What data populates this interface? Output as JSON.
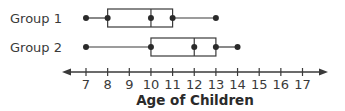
{
  "chart_data": {
    "type": "boxplot",
    "title": "",
    "xlabel": "Age of Children",
    "ylabel": "",
    "x_ticks": [
      7,
      8,
      9,
      10,
      11,
      12,
      13,
      14,
      15,
      16,
      17
    ],
    "xlim": [
      6,
      18
    ],
    "grid": false,
    "legend": null,
    "series": [
      {
        "name": "Group 1",
        "min": 7,
        "q1": 8,
        "median": 10,
        "q3": 11,
        "max": 13
      },
      {
        "name": "Group 2",
        "min": 7,
        "q1": 10,
        "median": 12,
        "q3": 13,
        "max": 14
      }
    ],
    "colors": {
      "line": "#3a3a3a",
      "dot": "#2a2a2a"
    }
  }
}
